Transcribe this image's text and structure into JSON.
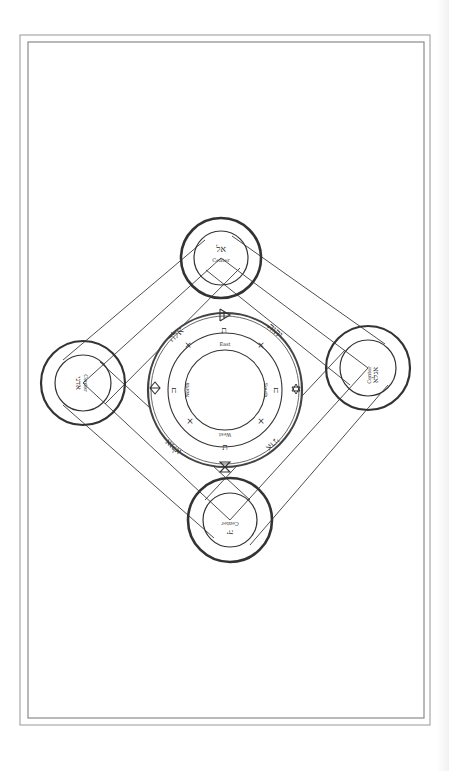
{
  "figure": {
    "type": "ceremonial-seal-diagram",
    "frame": {
      "outer": [
        20,
        35,
        430,
        725
      ],
      "inner": [
        28,
        42,
        424,
        718
      ],
      "stroke": "#9a9a9a"
    },
    "ink": "#2a2a2a"
  },
  "corner_circles": [
    {
      "id": "top",
      "hebrew": "אל",
      "label": "Center",
      "cx": 221,
      "cy": 258,
      "r_outer": 40,
      "r_inner": 27,
      "rotate": 0
    },
    {
      "id": "left",
      "hebrew": "אדני",
      "label": "Center",
      "cx": 83,
      "cy": 383,
      "r_outer": 42,
      "r_inner": 28,
      "rotate": 90
    },
    {
      "id": "right",
      "hebrew": "אגלא",
      "label": "Center",
      "cx": 368,
      "cy": 368,
      "r_outer": 42,
      "r_inner": 28,
      "rotate": -90
    },
    {
      "id": "bottom",
      "hebrew": "יה",
      "label": "Center",
      "cx": 230,
      "cy": 520,
      "r_outer": 42,
      "r_inner": 27,
      "rotate": 180
    }
  ],
  "central_seal": {
    "cx": 225,
    "cy": 390,
    "rings": [
      76,
      73,
      56,
      40
    ],
    "directions": {
      "top": "East",
      "right": "South",
      "bottom": "West",
      "left": "North"
    },
    "outer_names": {
      "top_left": "אלה",
      "top_right": "יהוה",
      "bottom_right": "אדני",
      "bottom_left": "אגלא"
    },
    "outer_symbols": {
      "top": "flame-sigil",
      "right": "hexagram",
      "bottom": "hourglass",
      "left": "diamond-sigil"
    },
    "middle_letters": {
      "top": "ת",
      "right": "ח",
      "bottom": "ת",
      "left": "ח"
    },
    "crosses": [
      "×",
      "×",
      "×",
      "×"
    ]
  }
}
